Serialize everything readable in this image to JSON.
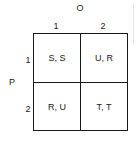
{
  "matrix": {
    "column_player": "O",
    "row_player": "P",
    "column_strategies": [
      "1",
      "2"
    ],
    "row_strategies": [
      "1",
      "2"
    ],
    "payoffs": [
      [
        "S, S",
        "U, R"
      ],
      [
        "R, U",
        "T, T"
      ]
    ]
  }
}
